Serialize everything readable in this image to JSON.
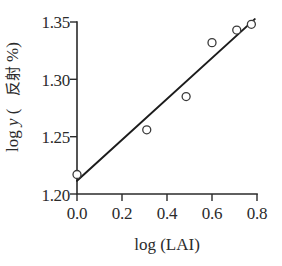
{
  "figure": {
    "background_color": "#ffffff",
    "ink_color": "#2b2b2b"
  },
  "chart_data": {
    "type": "scatter",
    "title": "",
    "subtitle": "",
    "xlabel": "log (LAI)",
    "ylabel": "log y (反射 %)",
    "ylabel_parts": {
      "prefix": "log ",
      "variable": "y",
      "paren_open": " (",
      "cjk": "反射",
      "percent": " %",
      "paren_close": ")"
    },
    "xlim": [
      0.0,
      0.8
    ],
    "ylim": [
      1.2,
      1.35
    ],
    "xticks": [
      0.0,
      0.2,
      0.4,
      0.6,
      0.8
    ],
    "xtick_labels": [
      "0.0",
      "0.2",
      "0.4",
      "0.6",
      "0.8"
    ],
    "yticks": [
      1.2,
      1.25,
      1.3,
      1.35
    ],
    "ytick_labels": [
      "1.20",
      "1.25",
      "1.30",
      "1.35"
    ],
    "grid": false,
    "legend": false,
    "marker_style": "open-circle",
    "marker_radius": 4,
    "x": [
      0.0,
      0.31,
      0.485,
      0.6,
      0.71,
      0.775
    ],
    "y": [
      1.217,
      1.256,
      1.285,
      1.332,
      1.343,
      1.348
    ],
    "points": [
      {
        "x": 0.0,
        "y": 1.217
      },
      {
        "x": 0.31,
        "y": 1.256
      },
      {
        "x": 0.485,
        "y": 1.285
      },
      {
        "x": 0.6,
        "y": 1.332
      },
      {
        "x": 0.71,
        "y": 1.343
      },
      {
        "x": 0.775,
        "y": 1.348
      }
    ],
    "fit_line": {
      "type": "linear",
      "x_start": 0.0,
      "y_start": 1.2115,
      "x_end": 0.79,
      "y_end": 1.3525
    },
    "annotations": []
  }
}
